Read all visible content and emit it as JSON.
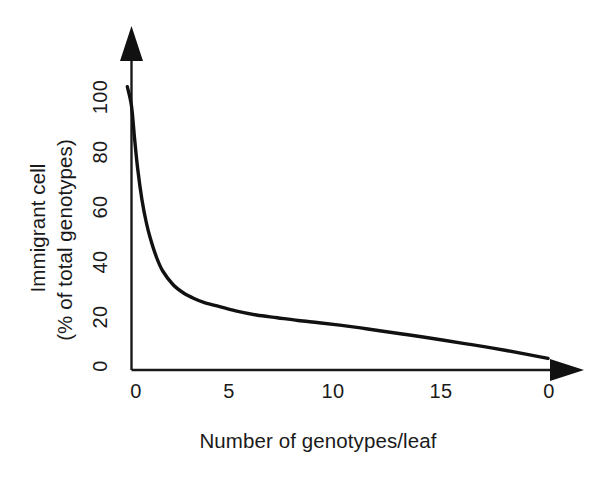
{
  "chart_data": {
    "type": "line",
    "title": "",
    "subtitle": "",
    "xlabel": "Number of genotypes/leaf",
    "ylabel_line1": "Immigrant cell",
    "ylabel_line2": "(% of total genotypes)",
    "ylabel": "Immigrant cell (% of total genotypes)",
    "xlim": [
      -0.3,
      21.0
    ],
    "ylim": [
      0,
      108
    ],
    "xticks": [
      0,
      5,
      10,
      15,
      20
    ],
    "xtick_labels": [
      "0",
      "5",
      "10",
      "15",
      "20"
    ],
    "yticks": [
      0,
      20,
      40,
      60,
      80,
      100
    ],
    "ytick_labels": [
      "0",
      "20",
      "40",
      "60",
      "80",
      "100"
    ],
    "grid": false,
    "legend": false,
    "legend_position": "none",
    "axis_style": "arrow-terminated L-shape (open top and right)",
    "series": [
      {
        "name": "Immigrant cell percentage",
        "color": "#111111",
        "x": [
          -0.2,
          0.0,
          0.15,
          0.3,
          0.5,
          0.7,
          0.9,
          1.2,
          1.5,
          2.0,
          2.5,
          3.0,
          3.5,
          4.0,
          5.0,
          6.0,
          7.0,
          8.0,
          9.0,
          10.0,
          11.0,
          12.0,
          13.0,
          14.0,
          15.0,
          16.0,
          17.0,
          18.0,
          19.0,
          20.0
        ],
        "y": [
          103,
          96,
          84,
          73,
          62,
          54,
          48,
          41,
          36,
          31,
          28,
          26,
          24.5,
          23.5,
          21.5,
          20,
          19,
          18,
          17.2,
          16.3,
          15.3,
          14.2,
          13.1,
          12.0,
          10.8,
          9.6,
          8.4,
          7.1,
          5.7,
          4.2
        ]
      }
    ],
    "annotations": [],
    "colors": {
      "curve": "#111111",
      "axis": "#1a1a1a",
      "text": "#1a1a1a",
      "background": "#ffffff"
    }
  }
}
